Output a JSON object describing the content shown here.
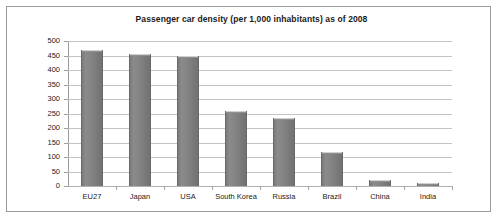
{
  "chart_data": {
    "type": "bar",
    "title": "Passenger car density (per 1,000 inhabitants) as of 2008",
    "xlabel": "",
    "ylabel": "",
    "categories": [
      "EU27",
      "Japan",
      "USA",
      "South Korea",
      "Russia",
      "Brazil",
      "China",
      "India"
    ],
    "values": [
      470,
      455,
      448,
      258,
      233,
      117,
      22,
      11
    ],
    "series": [
      {
        "name": "Passenger car density",
        "values": [
          470,
          455,
          448,
          258,
          233,
          117,
          22,
          11
        ]
      }
    ],
    "ylim": [
      0,
      500
    ],
    "ytick_labels": [
      "500",
      "450",
      "400",
      "350",
      "300",
      "250",
      "200",
      "150",
      "100",
      "50",
      "0"
    ],
    "ytick_values": [
      500,
      450,
      400,
      350,
      300,
      250,
      200,
      150,
      100,
      50,
      0
    ],
    "ytick_step": 50,
    "grid": true,
    "legend": false,
    "legend_position": "none",
    "bar_color": "#808080",
    "grid_color": "#c4c4c4",
    "axis_color": "#9d9d9d",
    "text_color": "#1a1a1a",
    "border_color": "#9a9a9a",
    "background_color": "#ffffff"
  }
}
